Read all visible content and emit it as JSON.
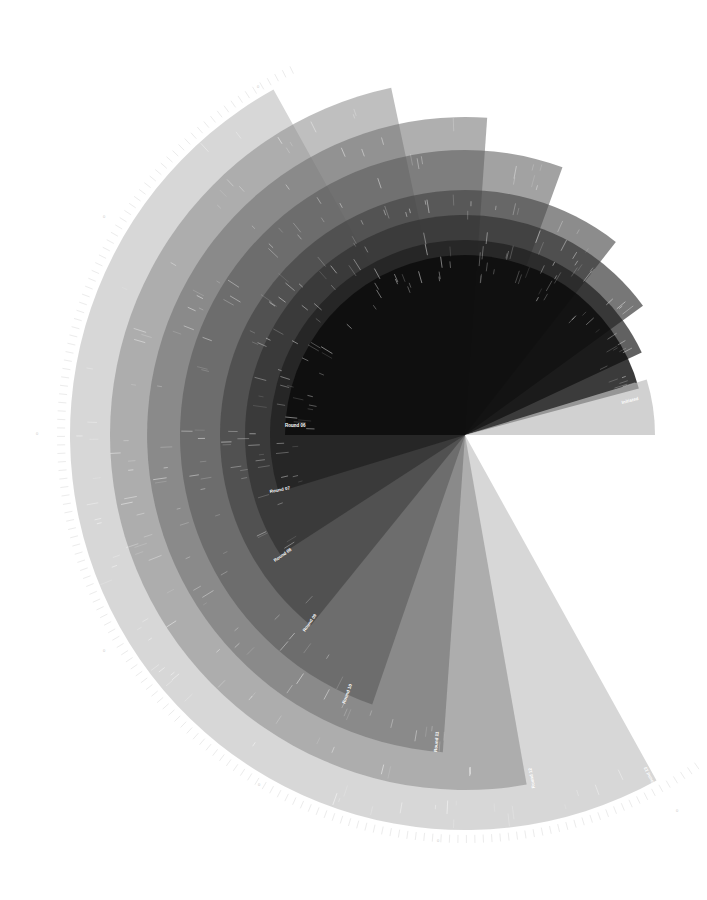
{
  "chart_data": {
    "type": "radial-sector",
    "title": "",
    "center": [
      465,
      435
    ],
    "angle_convention": "degrees, 0 = right, clockwise on screen",
    "series": [
      {
        "name": "Round 13",
        "radius": 395,
        "start_angle": 61,
        "end_angle": 241,
        "color": "#bdbdbd",
        "opacity": 0.6
      },
      {
        "name": "Round 12",
        "radius": 355,
        "start_angle": 80,
        "end_angle": 258,
        "color": "#8a8a8a",
        "opacity": 0.55
      },
      {
        "name": "Round 11",
        "radius": 318,
        "start_angle": 94,
        "end_angle": 274,
        "color": "#6e6e6e",
        "opacity": 0.55
      },
      {
        "name": "Round 10",
        "radius": 285,
        "start_angle": 109,
        "end_angle": 290,
        "color": "#555555",
        "opacity": 0.55
      },
      {
        "name": "Round 09",
        "radius": 245,
        "start_angle": 129,
        "end_angle": 308,
        "color": "#404040",
        "opacity": 0.6
      },
      {
        "name": "Round 08",
        "radius": 220,
        "start_angle": 147,
        "end_angle": 324,
        "color": "#2e2e2e",
        "opacity": 0.65
      },
      {
        "name": "Round 07",
        "radius": 195,
        "start_angle": 163,
        "end_angle": 335,
        "color": "#1e1e1e",
        "opacity": 0.7
      },
      {
        "name": "Round 06",
        "radius": 180,
        "start_angle": 180,
        "end_angle": 345,
        "color": "#0a0a0a",
        "opacity": 0.8
      },
      {
        "name": "Initiated",
        "radius": 190,
        "start_angle": 343,
        "end_angle": 360,
        "color": "#bdbdbd",
        "opacity": 0.7
      }
    ],
    "labels": [
      {
        "text": "Round 06",
        "x": 285,
        "y": 427,
        "rotate": 0
      },
      {
        "text": "Round 07",
        "x": 270,
        "y": 493,
        "rotate": -10
      },
      {
        "text": "Round 08",
        "x": 275,
        "y": 562,
        "rotate": -35
      },
      {
        "text": "Round 09",
        "x": 305,
        "y": 632,
        "rotate": -55
      },
      {
        "text": "Round 10",
        "x": 345,
        "y": 704,
        "rotate": -70
      },
      {
        "text": "Round 11",
        "x": 437,
        "y": 752,
        "rotate": -85
      },
      {
        "text": "Round 12",
        "x": 535,
        "y": 788,
        "rotate": -100
      },
      {
        "text": "Round 13",
        "x": 655,
        "y": 785,
        "rotate": -115
      },
      {
        "text": "Initiated",
        "x": 622,
        "y": 404,
        "rotate": -14
      }
    ],
    "outer_tick_labels": [
      {
        "text": "0",
        "x": 257,
        "y": 88
      },
      {
        "text": "0",
        "x": 103,
        "y": 218
      },
      {
        "text": "0",
        "x": 36,
        "y": 435
      },
      {
        "text": "0",
        "x": 103,
        "y": 652
      },
      {
        "text": "0",
        "x": 258,
        "y": 786
      },
      {
        "text": "0",
        "x": 437,
        "y": 842
      },
      {
        "text": "0",
        "x": 676,
        "y": 812
      }
    ],
    "xlabel": "",
    "ylabel": "",
    "grid": false,
    "legend": "none"
  }
}
